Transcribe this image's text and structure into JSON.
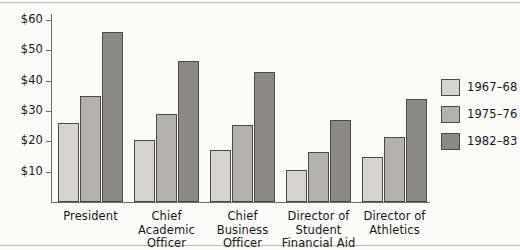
{
  "chart_data": {
    "type": "bar",
    "title": "",
    "subtitle": "",
    "xlabel": "",
    "ylabel": "",
    "ylim": [
      0,
      62
    ],
    "grid": false,
    "legend_position": "right",
    "categories": [
      "President",
      "Chief\nAcademic\nOfficer",
      "Chief\nBusiness\nOfficer",
      "Director of\nStudent\nFinancial Aid",
      "Director of\nAthletics"
    ],
    "category_lines": [
      [
        "President"
      ],
      [
        "Chief",
        "Academic",
        "Officer"
      ],
      [
        "Chief",
        "Business",
        "Officer"
      ],
      [
        "Director of",
        "Student",
        "Financial Aid"
      ],
      [
        "Director of",
        "Athletics"
      ]
    ],
    "ytick_values": [
      10,
      20,
      30,
      40,
      50,
      60
    ],
    "ytick_labels": [
      "$10",
      "$20",
      "$30",
      "$40",
      "$50",
      "$60"
    ],
    "series": [
      {
        "name": "1967–68",
        "color": "#d5d4d1",
        "values": [
          26,
          20.5,
          17,
          10.5,
          15
        ]
      },
      {
        "name": "1975–76",
        "color": "#b2b1ae",
        "values": [
          35,
          29,
          25.5,
          16.5,
          21.5
        ]
      },
      {
        "name": "1982–83",
        "color": "#8a8987",
        "values": [
          56,
          46.5,
          43,
          27,
          34
        ]
      }
    ]
  },
  "legend": {
    "items": [
      {
        "label": "1967–68",
        "color": "#d5d4d1"
      },
      {
        "label": "1975–76",
        "color": "#b2b1ae"
      },
      {
        "label": "1982–83",
        "color": "#8a8987"
      }
    ]
  },
  "colors": {
    "axis": "#6d6c6a",
    "bar_border": "#4a4947",
    "text": "#191815",
    "background": "#fbfbfa",
    "frame": "#b9b8b5"
  }
}
